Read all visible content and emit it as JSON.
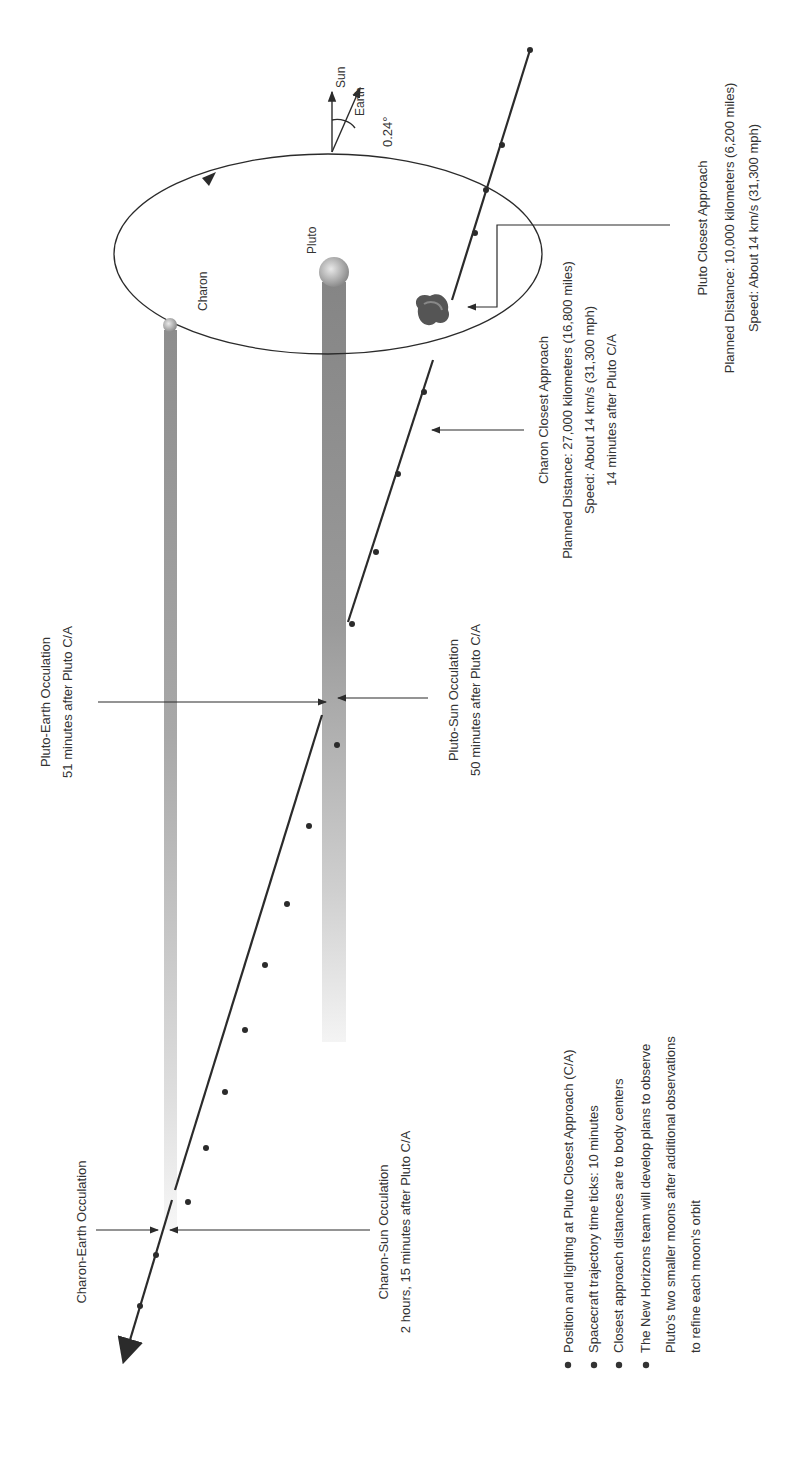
{
  "diagram": {
    "bodies": {
      "pluto_label": "Pluto",
      "charon_label": "Charon"
    },
    "direction": {
      "sun_label": "Sun",
      "earth_label": "Earth",
      "angle_label": "0.24°"
    },
    "pluto_ca": {
      "title": "Pluto Closest Approach",
      "line1": "Planned Distance: 10,000 kilometers (6,200 miles)",
      "line2": "Speed: About 14 km/s (31,300 mph)"
    },
    "charon_ca": {
      "title": "Charon Closest Approach",
      "line1": "Planned Distance: 27,000 kilometers (16,800 miles)",
      "line2": "Speed: About 14 km/s (31,300 mph)",
      "line3": "14 minutes after Pluto C/A"
    },
    "pluto_earth_occ": {
      "title": "Pluto-Earth Occulation",
      "line1": "51 minutes after Pluto C/A"
    },
    "pluto_sun_occ": {
      "title": "Pluto-Sun Occulation",
      "line1": "50 minutes after Pluto C/A"
    },
    "charon_earth_occ": {
      "title": "Charon-Earth Occulation"
    },
    "charon_sun_occ": {
      "title": "Charon-Sun Occulation",
      "line1": "2 hours, 15 minutes after Pluto C/A"
    },
    "notes": [
      "Position and lighting at Pluto Closest Approach (C/A)",
      "Spacecraft trajectory time ticks:  10 minutes",
      "Closest approach distances are to body centers",
      "The New Horizons team will develop plans to observe",
      "Pluto's two smaller moons after additional observations",
      "to refine each moon's orbit"
    ],
    "colors": {
      "line": "#2b2b2b",
      "shadow": "#8a8a8a",
      "body": "#b5b5b5"
    }
  }
}
